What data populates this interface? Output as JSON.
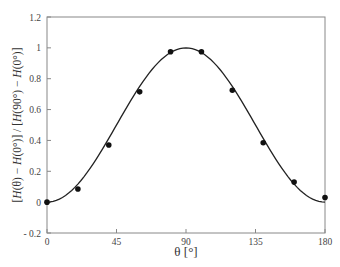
{
  "chart_data": {
    "type": "scatter",
    "title": "",
    "xlabel": "θ [°]",
    "ylabel": "[H(θ) − H(0°)] / [H(90°) − H(0°)]",
    "xlim": [
      0,
      180
    ],
    "ylim": [
      -0.2,
      1.2
    ],
    "x_ticks": [
      0,
      45,
      90,
      135,
      180
    ],
    "x_tick_labels": [
      "0",
      "45",
      "90",
      "135",
      "180"
    ],
    "y_ticks": [
      -0.2,
      0,
      0.2,
      0.4,
      0.6,
      0.8,
      1,
      1.2
    ],
    "y_tick_labels": [
      "- 0.2",
      "0",
      "0.2",
      "0.4",
      "0.6",
      "0.8",
      "1",
      "1.2"
    ],
    "grid": false,
    "legend": null,
    "series": [
      {
        "name": "measured",
        "kind": "scatter",
        "marker": "filled-circle",
        "color": "#111111",
        "x": [
          0,
          20,
          40,
          60,
          80,
          100,
          120,
          140,
          160,
          180
        ],
        "y": [
          0.0,
          0.085,
          0.37,
          0.715,
          0.975,
          0.975,
          0.725,
          0.385,
          0.13,
          0.03
        ]
      },
      {
        "name": "fit sin²θ",
        "kind": "line",
        "color": "#222222",
        "function": "sin^2(theta)"
      }
    ]
  }
}
